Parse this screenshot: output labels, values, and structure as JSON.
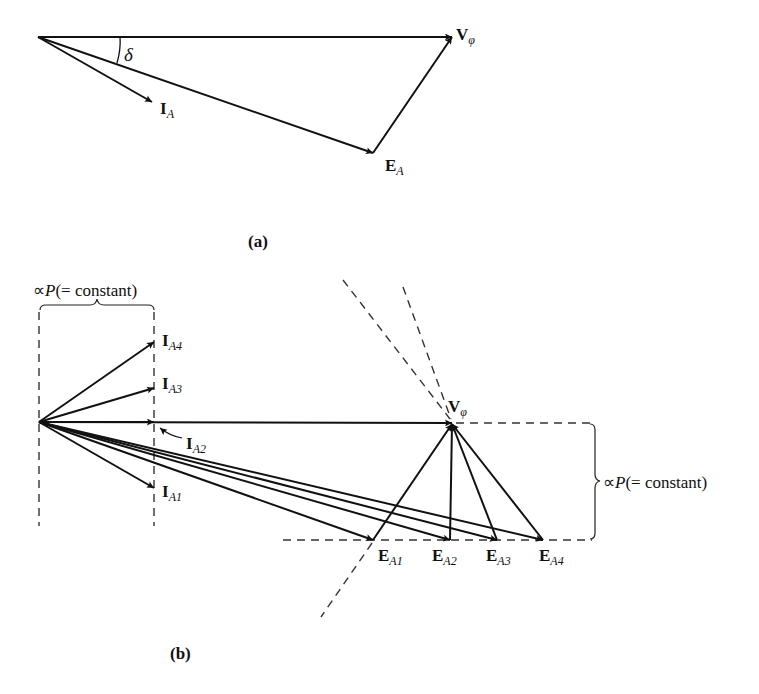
{
  "figure": {
    "part_a": {
      "caption": "(a)",
      "origin": [
        38,
        37
      ],
      "vectors": [
        {
          "name": "V_phi",
          "label_main": "V",
          "label_sub": "φ",
          "from": [
            38,
            37
          ],
          "to": [
            452,
            37
          ]
        },
        {
          "name": "E_A",
          "label_main": "E",
          "label_sub": "A",
          "from": [
            38,
            37
          ],
          "to": [
            373,
            153
          ]
        },
        {
          "name": "I_A",
          "label_main": "I",
          "label_sub": "A",
          "from": [
            38,
            37
          ],
          "to": [
            152,
            102
          ]
        },
        {
          "name": "jXsIa",
          "from": [
            373,
            153
          ],
          "to": [
            452,
            37
          ]
        }
      ],
      "angle_label": "δ"
    },
    "part_b": {
      "caption": "(b)",
      "top_brace_label_prefix": "∝",
      "top_brace_label_var": "P",
      "top_brace_label_rest": "(= constant)",
      "right_brace_label_prefix": "∝",
      "right_brace_label_var": "P",
      "right_brace_label_rest": "(= constant)",
      "currents": [
        {
          "label_main": "I",
          "label_sub": "A1",
          "to": [
            154,
            488
          ]
        },
        {
          "label_main": "I",
          "label_sub": "A2",
          "to": [
            154,
            422
          ]
        },
        {
          "label_main": "I",
          "label_sub": "A3",
          "to": [
            154,
            388
          ]
        },
        {
          "label_main": "I",
          "label_sub": "A4",
          "to": [
            154,
            342
          ]
        }
      ],
      "voltage": {
        "label_main": "V",
        "label_sub": "φ",
        "to": [
          452,
          423
        ]
      },
      "emfs": [
        {
          "label_main": "E",
          "label_sub": "A1",
          "to": [
            373,
            540
          ]
        },
        {
          "label_main": "E",
          "label_sub": "A2",
          "to": [
            450,
            540
          ]
        },
        {
          "label_main": "E",
          "label_sub": "A3",
          "to": [
            497,
            540
          ]
        },
        {
          "label_main": "E",
          "label_sub": "A4",
          "to": [
            543,
            540
          ]
        }
      ]
    }
  }
}
